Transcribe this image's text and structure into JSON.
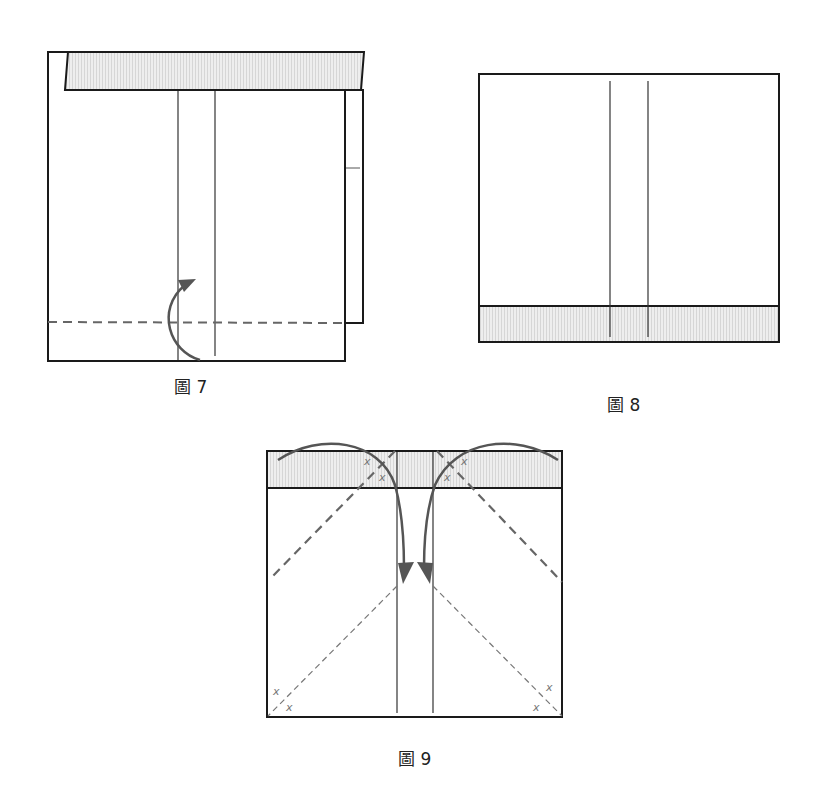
{
  "figures": [
    {
      "id": "fig7",
      "caption": "圖 7",
      "description": "Square with shaded top flap; valley fold line near bottom with curved arrow folding up"
    },
    {
      "id": "fig8",
      "caption": "圖 8",
      "description": "Rectangle with two vertical center creases and shaded bottom strip"
    },
    {
      "id": "fig9",
      "caption": "圖 9",
      "description": "Square with shaded top band, diagonal fold lines, x markers and two curved arrows folding corners down to the center"
    }
  ],
  "markers": {
    "x_label": "x"
  },
  "colors": {
    "outline": "#1a1a1a",
    "shade": "#e6e6e6",
    "arrow": "#555555",
    "dash": "#666666"
  }
}
